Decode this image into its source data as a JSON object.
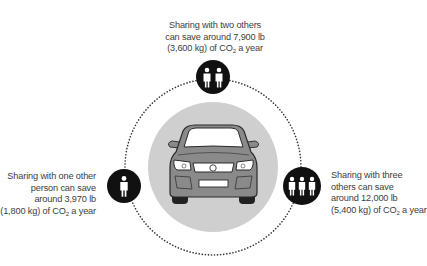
{
  "diagram": {
    "center": {
      "label": "car-front-view",
      "icon": "car-icon"
    },
    "nodes": [
      {
        "id": "two-others",
        "people": 2,
        "icon": "two-people-icon",
        "caption": [
          "Sharing with two others",
          "can save around 7,900 lb",
          "(3,600 kg) of CO",
          " a year"
        ],
        "co2_sub": "2"
      },
      {
        "id": "one-other",
        "people": 1,
        "icon": "one-person-icon",
        "caption": [
          "Sharing with one other",
          "person can save",
          "around 3,970 lb",
          "(1,800 kg) of CO",
          " a year"
        ],
        "co2_sub": "2"
      },
      {
        "id": "three-others",
        "people": 3,
        "icon": "three-people-icon",
        "caption": [
          "Sharing with three",
          "others can save",
          "around 12,000 lb",
          "(5,400 kg) of CO",
          " a year"
        ],
        "co2_sub": "2"
      }
    ],
    "colors": {
      "node_fill": "#111111",
      "center_fill": "#cccccc",
      "car_body": "#8a8a8a",
      "dots": "#333333"
    }
  }
}
